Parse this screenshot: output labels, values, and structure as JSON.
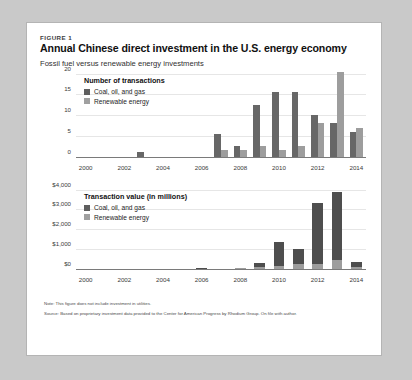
{
  "figure": {
    "label": "FIGURE 1",
    "title": "Annual Chinese direct investment in the U.S. energy economy",
    "subtitle": "Fossil fuel versus renewable energy investments"
  },
  "notes": {
    "note": "Note: This figure does not include investment in utilities.",
    "source": "Source: Based on proprietary investment data provided to the Center for American Progress by Rhodium Group. On file with author."
  },
  "colors": {
    "coal": "#676767",
    "renewable": "#9d9d9d",
    "axis": "#7a7a7a",
    "grid": "#e6e6e6",
    "card_background": "#ffffff",
    "page_background": "#c9c9c9"
  },
  "chart_data": [
    {
      "type": "bar",
      "id": "number-of-transactions",
      "title": "Number of transactions",
      "xlabel": "",
      "ylabel": "",
      "ylim": [
        0,
        20
      ],
      "yticks": [
        0,
        5,
        10,
        15,
        20
      ],
      "ytick_labels": [
        "0",
        "5",
        "10",
        "15",
        "20"
      ],
      "grid": true,
      "legend_position": "top-left",
      "grouping": "grouped",
      "categories": [
        2000,
        2001,
        2002,
        2003,
        2004,
        2005,
        2006,
        2007,
        2008,
        2009,
        2010,
        2011,
        2012,
        2013,
        2014
      ],
      "xtick_labels": [
        "2000",
        "2002",
        "2004",
        "2006",
        "2008",
        "2010",
        "2012",
        "2014"
      ],
      "xticks": [
        2000,
        2002,
        2004,
        2006,
        2008,
        2010,
        2012,
        2014
      ],
      "series": [
        {
          "name": "Coal, oil, and gas",
          "color": "#676767",
          "values": [
            0,
            0,
            0,
            1,
            0,
            0,
            0,
            5.5,
            2.5,
            12.5,
            15.5,
            15.5,
            10,
            8,
            6
          ]
        },
        {
          "name": "Renewable energy",
          "color": "#9d9d9d",
          "values": [
            0,
            0,
            0,
            0,
            0,
            0,
            0,
            1.5,
            1.5,
            2.5,
            1.5,
            2.5,
            8,
            20.5,
            7
          ]
        }
      ]
    },
    {
      "type": "bar",
      "id": "transaction-value",
      "title": "Transaction value (in millions)",
      "xlabel": "",
      "ylabel": "",
      "ylim": [
        0,
        4000
      ],
      "yticks": [
        0,
        1000,
        2000,
        3000,
        4000
      ],
      "ytick_labels": [
        "$0",
        "$1,000",
        "$2,000",
        "$3,000",
        "$4,000"
      ],
      "grid": true,
      "legend_position": "top-left",
      "grouping": "stacked",
      "categories": [
        2000,
        2001,
        2002,
        2003,
        2004,
        2005,
        2006,
        2007,
        2008,
        2009,
        2010,
        2011,
        2012,
        2013,
        2014
      ],
      "xtick_labels": [
        "2000",
        "2002",
        "2004",
        "2006",
        "2008",
        "2010",
        "2012",
        "2014"
      ],
      "xticks": [
        2000,
        2002,
        2004,
        2006,
        2008,
        2010,
        2012,
        2014
      ],
      "series": [
        {
          "name": "Coal, oil, and gas",
          "color": "#4e4e4e",
          "values": [
            0,
            0,
            0,
            0,
            0,
            0,
            30,
            0,
            0,
            240,
            1220,
            760,
            3060,
            3440,
            220
          ]
        },
        {
          "name": "Renewable energy",
          "color": "#9d9d9d",
          "values": [
            0,
            0,
            0,
            0,
            0,
            0,
            0,
            0,
            30,
            60,
            120,
            240,
            240,
            420,
            100
          ]
        }
      ]
    }
  ]
}
